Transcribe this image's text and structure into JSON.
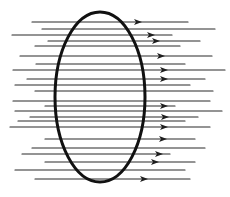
{
  "diagram": {
    "colors": {
      "background": "#ffffff",
      "lines": "#2a2a2a",
      "loop": "#111111"
    },
    "loop": {
      "shape": "ellipse",
      "cx": 100,
      "cy": 97,
      "rx": 45,
      "ry": 85,
      "stroke_width": 3
    },
    "field_direction": "right",
    "field_lines": [
      {
        "y": 22,
        "x1": 32,
        "x2": 188,
        "arrow_x": 140
      },
      {
        "y": 29,
        "x1": 42,
        "x2": 215,
        "arrow_x": null
      },
      {
        "y": 35,
        "x1": 12,
        "x2": 172,
        "arrow_x": 153
      },
      {
        "y": 41,
        "x1": 48,
        "x2": 200,
        "arrow_x": 158
      },
      {
        "y": 46,
        "x1": 35,
        "x2": 180,
        "arrow_x": null
      },
      {
        "y": 56,
        "x1": 20,
        "x2": 212,
        "arrow_x": 163
      },
      {
        "y": 64,
        "x1": 36,
        "x2": 185,
        "arrow_x": null
      },
      {
        "y": 70,
        "x1": 13,
        "x2": 225,
        "arrow_x": 166
      },
      {
        "y": 79,
        "x1": 27,
        "x2": 205,
        "arrow_x": 166
      },
      {
        "y": 85,
        "x1": 15,
        "x2": 190,
        "arrow_x": null
      },
      {
        "y": 91,
        "x1": 35,
        "x2": 213,
        "arrow_x": null
      },
      {
        "y": 101,
        "x1": 13,
        "x2": 210,
        "arrow_x": null
      },
      {
        "y": 106,
        "x1": 45,
        "x2": 175,
        "arrow_x": 166
      },
      {
        "y": 111,
        "x1": 15,
        "x2": 222,
        "arrow_x": null
      },
      {
        "y": 117,
        "x1": 30,
        "x2": 198,
        "arrow_x": 167
      },
      {
        "y": 121,
        "x1": 18,
        "x2": 185,
        "arrow_x": null
      },
      {
        "y": 127,
        "x1": 10,
        "x2": 210,
        "arrow_x": 166
      },
      {
        "y": 139,
        "x1": 45,
        "x2": 195,
        "arrow_x": 165
      },
      {
        "y": 148,
        "x1": 32,
        "x2": 205,
        "arrow_x": null
      },
      {
        "y": 154,
        "x1": 22,
        "x2": 170,
        "arrow_x": 161
      },
      {
        "y": 162,
        "x1": 45,
        "x2": 195,
        "arrow_x": 157
      },
      {
        "y": 170,
        "x1": 15,
        "x2": 185,
        "arrow_x": null
      },
      {
        "y": 179,
        "x1": 35,
        "x2": 190,
        "arrow_x": 146
      }
    ]
  }
}
